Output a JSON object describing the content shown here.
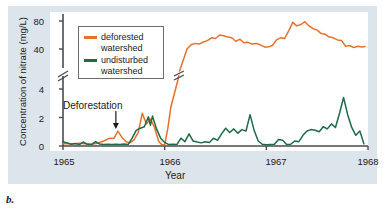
{
  "caption": "b.",
  "chart_data": {
    "type": "line",
    "title": "",
    "xlabel": "Year",
    "ylabel": "Concentration of nitrate (mg/L)",
    "xlim": [
      1965.0,
      1968.0
    ],
    "xticks": [
      1965,
      1966,
      1967,
      1968
    ],
    "xtick_labels": [
      "1965",
      "1966",
      "1967",
      "1968"
    ],
    "yticks_lower": [
      0,
      2,
      4
    ],
    "ytick_labels_lower": [
      "0",
      "2",
      "4"
    ],
    "yticks_upper": [
      40,
      80
    ],
    "ytick_labels_upper": [
      "40",
      "80"
    ],
    "ylim_lower": [
      0,
      4.6
    ],
    "ylim_upper": [
      33,
      85
    ],
    "axis_break": true,
    "axis_break_note": "y-axis broken between 4 and 40 mg/L",
    "grid": false,
    "legend_position": "upper-left-inside",
    "annotations": [
      {
        "text": "Deforestation",
        "x": 1965.52,
        "y": 2.6,
        "arrow": "down"
      }
    ],
    "series": [
      {
        "name": "deforested watershed",
        "color": "#e8702a",
        "points": [
          [
            1965.0,
            0.15
          ],
          [
            1965.05,
            0.18
          ],
          [
            1965.1,
            0.14
          ],
          [
            1965.16,
            0.2
          ],
          [
            1965.22,
            0.16
          ],
          [
            1965.28,
            0.13
          ],
          [
            1965.34,
            0.2
          ],
          [
            1965.4,
            0.35
          ],
          [
            1965.46,
            0.55
          ],
          [
            1965.5,
            0.52
          ],
          [
            1965.54,
            1.05
          ],
          [
            1965.58,
            0.6
          ],
          [
            1965.62,
            0.3
          ],
          [
            1965.66,
            0.22
          ],
          [
            1965.7,
            0.45
          ],
          [
            1965.74,
            0.95
          ],
          [
            1965.78,
            2.3
          ],
          [
            1965.82,
            1.55
          ],
          [
            1965.86,
            1.9
          ],
          [
            1965.9,
            1.3
          ],
          [
            1965.94,
            0.35
          ],
          [
            1965.97,
            0.1
          ],
          [
            1966.0,
            0.08
          ],
          [
            1966.03,
            1.2
          ],
          [
            1966.06,
            2.7
          ],
          [
            1966.09,
            8.0
          ],
          [
            1966.12,
            18.0
          ],
          [
            1966.15,
            27.0
          ],
          [
            1966.18,
            34.0
          ],
          [
            1966.22,
            40.0
          ],
          [
            1966.26,
            46.0
          ],
          [
            1966.3,
            48.0
          ],
          [
            1966.34,
            47.0
          ],
          [
            1966.38,
            50.0
          ],
          [
            1966.42,
            52.0
          ],
          [
            1966.46,
            56.0
          ],
          [
            1966.5,
            55.0
          ],
          [
            1966.54,
            60.0
          ],
          [
            1966.58,
            59.0
          ],
          [
            1966.62,
            57.0
          ],
          [
            1966.66,
            56.0
          ],
          [
            1966.7,
            51.0
          ],
          [
            1966.74,
            54.0
          ],
          [
            1966.78,
            49.0
          ],
          [
            1966.82,
            49.5
          ],
          [
            1966.86,
            47.0
          ],
          [
            1966.9,
            48.0
          ],
          [
            1966.94,
            46.0
          ],
          [
            1966.98,
            43.0
          ],
          [
            1967.02,
            43.0
          ],
          [
            1967.06,
            45.0
          ],
          [
            1967.1,
            53.0
          ],
          [
            1967.14,
            56.0
          ],
          [
            1967.18,
            55.0
          ],
          [
            1967.22,
            66.0
          ],
          [
            1967.26,
            78.0
          ],
          [
            1967.3,
            73.0
          ],
          [
            1967.34,
            75.0
          ],
          [
            1967.38,
            79.0
          ],
          [
            1967.42,
            73.0
          ],
          [
            1967.46,
            69.0
          ],
          [
            1967.5,
            67.0
          ],
          [
            1967.54,
            62.0
          ],
          [
            1967.58,
            61.0
          ],
          [
            1967.62,
            57.0
          ],
          [
            1967.66,
            56.0
          ],
          [
            1967.7,
            53.0
          ],
          [
            1967.74,
            52.0
          ],
          [
            1967.78,
            44.0
          ],
          [
            1967.82,
            45.0
          ],
          [
            1967.86,
            42.0
          ],
          [
            1967.9,
            44.0
          ],
          [
            1967.94,
            43.0
          ],
          [
            1967.97,
            43.5
          ]
        ]
      },
      {
        "name": "undisturbed watershed",
        "color": "#1d6b47",
        "points": [
          [
            1965.0,
            0.3
          ],
          [
            1965.04,
            0.22
          ],
          [
            1965.08,
            0.12
          ],
          [
            1965.12,
            0.18
          ],
          [
            1965.16,
            0.1
          ],
          [
            1965.2,
            0.28
          ],
          [
            1965.24,
            0.12
          ],
          [
            1965.28,
            0.1
          ],
          [
            1965.32,
            0.3
          ],
          [
            1965.36,
            0.14
          ],
          [
            1965.4,
            0.1
          ],
          [
            1965.44,
            0.12
          ],
          [
            1965.48,
            0.1
          ],
          [
            1965.52,
            0.12
          ],
          [
            1965.56,
            0.1
          ],
          [
            1965.6,
            0.14
          ],
          [
            1965.64,
            0.1
          ],
          [
            1965.68,
            0.55
          ],
          [
            1965.72,
            1.1
          ],
          [
            1965.76,
            1.25
          ],
          [
            1965.8,
            1.35
          ],
          [
            1965.84,
            2.05
          ],
          [
            1965.86,
            1.45
          ],
          [
            1965.88,
            2.1
          ],
          [
            1965.92,
            1.2
          ],
          [
            1965.96,
            0.55
          ],
          [
            1966.0,
            0.25
          ],
          [
            1966.04,
            0.1
          ],
          [
            1966.08,
            0.12
          ],
          [
            1966.12,
            0.1
          ],
          [
            1966.16,
            0.55
          ],
          [
            1966.2,
            0.3
          ],
          [
            1966.24,
            0.85
          ],
          [
            1966.28,
            0.35
          ],
          [
            1966.32,
            0.28
          ],
          [
            1966.36,
            0.22
          ],
          [
            1966.4,
            0.3
          ],
          [
            1966.44,
            0.25
          ],
          [
            1966.48,
            0.55
          ],
          [
            1966.52,
            0.4
          ],
          [
            1966.56,
            0.85
          ],
          [
            1966.6,
            1.25
          ],
          [
            1966.64,
            0.95
          ],
          [
            1966.68,
            1.2
          ],
          [
            1966.72,
            0.9
          ],
          [
            1966.76,
            1.15
          ],
          [
            1966.8,
            1.05
          ],
          [
            1966.84,
            2.2
          ],
          [
            1966.88,
            1.1
          ],
          [
            1966.92,
            0.35
          ],
          [
            1966.96,
            0.12
          ],
          [
            1967.0,
            0.08
          ],
          [
            1967.04,
            0.1
          ],
          [
            1967.08,
            0.12
          ],
          [
            1967.12,
            0.45
          ],
          [
            1967.16,
            0.4
          ],
          [
            1967.2,
            0.1
          ],
          [
            1967.24,
            0.12
          ],
          [
            1967.28,
            0.35
          ],
          [
            1967.32,
            0.3
          ],
          [
            1967.36,
            0.75
          ],
          [
            1967.4,
            1.05
          ],
          [
            1967.44,
            1.15
          ],
          [
            1967.48,
            1.1
          ],
          [
            1967.52,
            1.0
          ],
          [
            1967.56,
            1.35
          ],
          [
            1967.6,
            1.2
          ],
          [
            1967.64,
            1.55
          ],
          [
            1967.68,
            1.3
          ],
          [
            1967.72,
            2.3
          ],
          [
            1967.76,
            3.4
          ],
          [
            1967.8,
            2.2
          ],
          [
            1967.84,
            1.3
          ],
          [
            1967.88,
            0.75
          ],
          [
            1967.92,
            1.05
          ],
          [
            1967.96,
            0.15
          ]
        ]
      }
    ]
  },
  "legend": {
    "items": [
      {
        "label_line1": "deforested",
        "label_line2": "watershed",
        "color": "#e8702a"
      },
      {
        "label_line1": "undisturbed",
        "label_line2": "watershed",
        "color": "#1d6b47"
      }
    ]
  }
}
